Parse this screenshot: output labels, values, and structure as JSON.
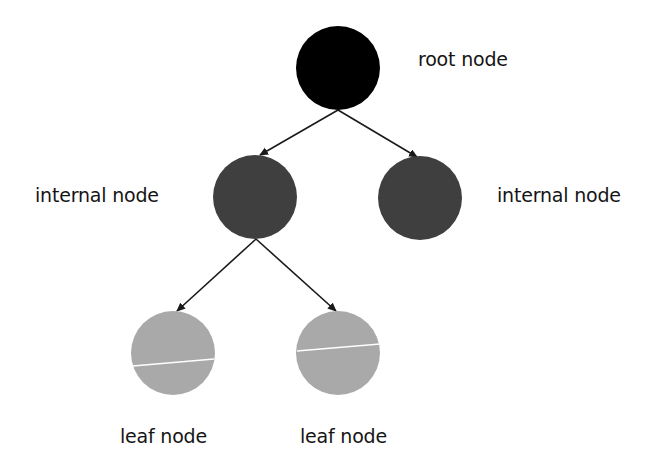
{
  "diagram": {
    "type": "tree",
    "colors": {
      "background": "#ffffff",
      "root": "#000000",
      "internal": "#3f3f3f",
      "leaf": "#a9a9a9",
      "edge": "#1a1a1a",
      "leaf_stripe": "#ffffff",
      "text": "#151515"
    },
    "nodes": [
      {
        "id": "root",
        "kind": "root",
        "cx": 338,
        "cy": 68,
        "r": 42,
        "label": "root node",
        "label_x": 418,
        "label_y": 52
      },
      {
        "id": "internal-left",
        "kind": "internal",
        "cx": 255,
        "cy": 197,
        "r": 42,
        "label": "internal node",
        "label_x": 35,
        "label_y": 188
      },
      {
        "id": "internal-right",
        "kind": "internal",
        "cx": 420,
        "cy": 198,
        "r": 42,
        "label": "internal node",
        "label_x": 497,
        "label_y": 188
      },
      {
        "id": "leaf-left",
        "kind": "leaf",
        "cx": 173,
        "cy": 353,
        "r": 42,
        "label": "leaf node",
        "label_x": 120,
        "label_y": 428,
        "stripe": [
          133,
          366,
          214,
          359
        ]
      },
      {
        "id": "leaf-right",
        "kind": "leaf",
        "cx": 338,
        "cy": 353,
        "r": 42,
        "label": "leaf node",
        "label_x": 300,
        "label_y": 428,
        "stripe": [
          297,
          351,
          380,
          344
        ]
      }
    ],
    "edges": [
      {
        "from": "root",
        "to": "internal-left",
        "x1": 338,
        "y1": 110,
        "x2": 260,
        "y2": 155
      },
      {
        "from": "root",
        "to": "internal-right",
        "x1": 338,
        "y1": 110,
        "x2": 417,
        "y2": 157
      },
      {
        "from": "internal-left",
        "to": "leaf-left",
        "x1": 256,
        "y1": 239,
        "x2": 177,
        "y2": 311
      },
      {
        "from": "internal-left",
        "to": "leaf-right",
        "x1": 256,
        "y1": 239,
        "x2": 336,
        "y2": 311
      }
    ]
  },
  "labels": {
    "root": "root node",
    "internal_left": "internal node",
    "internal_right": "internal node",
    "leaf_left": "leaf node",
    "leaf_right": "leaf node"
  }
}
